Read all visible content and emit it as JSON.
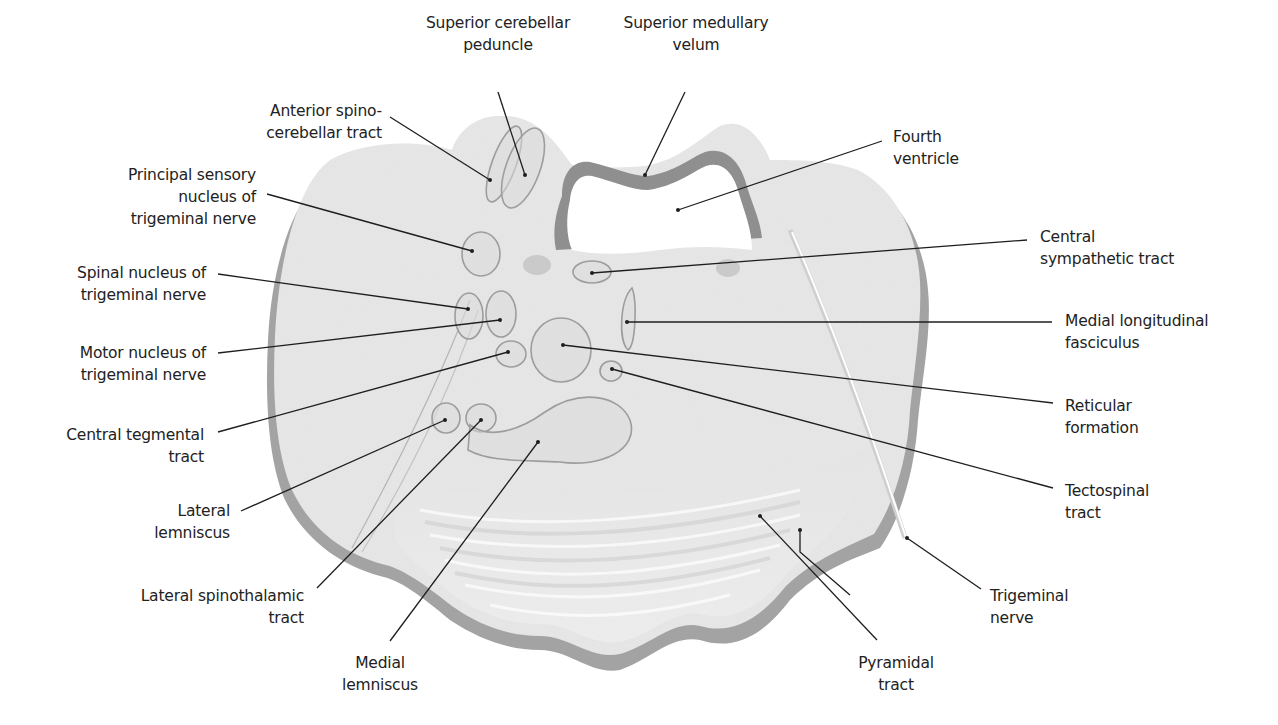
{
  "figure": {
    "colors": {
      "tissue": "#e6e6e6",
      "tissue_shadow": "#9a9a9a",
      "ventricle_rim": "#8c8c8c",
      "outline": "#9b9b9b",
      "leader_line": "#1e1e1e",
      "text": "#222222",
      "background": "#ffffff"
    }
  },
  "labels": {
    "superior_cerebellar_peduncle": {
      "line1": "Superior cerebellar",
      "line2": "peduncle"
    },
    "superior_medullary_velum": {
      "line1": "Superior medullary",
      "line2": "velum"
    },
    "anterior_spinocerebellar_tract": {
      "line1": "Anterior spino-",
      "line2": "cerebellar tract"
    },
    "fourth_ventricle": {
      "line1": "Fourth",
      "line2": "ventricle"
    },
    "principal_sensory_nucleus": {
      "line1": "Principal sensory",
      "line2": "nucleus of",
      "line3": "trigeminal nerve"
    },
    "central_sympathetic_tract": {
      "line1": "Central",
      "line2": "sympathetic tract"
    },
    "spinal_nucleus_trigeminal": {
      "line1": "Spinal nucleus of",
      "line2": "trigeminal nerve"
    },
    "medial_longitudinal_fasciculus": {
      "line1": "Medial longitudinal",
      "line2": "fasciculus"
    },
    "motor_nucleus_trigeminal": {
      "line1": "Motor nucleus of",
      "line2": "trigeminal nerve"
    },
    "reticular_formation": {
      "line1": "Reticular",
      "line2": "formation"
    },
    "central_tegmental_tract": {
      "line1": "Central tegmental",
      "line2": "tract"
    },
    "tectospinal_tract": {
      "line1": "Tectospinal",
      "line2": "tract"
    },
    "lateral_lemniscus": {
      "line1": "Lateral",
      "line2": "lemniscus"
    },
    "lateral_spinothalamic_tract": {
      "line1": "Lateral spinothalamic",
      "line2": "tract"
    },
    "trigeminal_nerve": {
      "line1": "Trigeminal",
      "line2": "nerve"
    },
    "medial_lemniscus": {
      "line1": "Medial",
      "line2": "lemniscus"
    },
    "pyramidal_tract": {
      "line1": "Pyramidal",
      "line2": "tract"
    }
  }
}
